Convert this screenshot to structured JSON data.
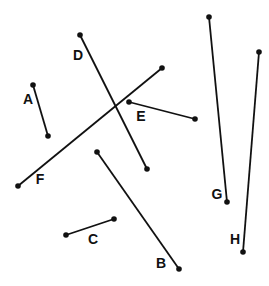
{
  "diagram": {
    "width": 269,
    "height": 286,
    "stroke_color": "#111111",
    "background": "#ffffff",
    "segments": [
      {
        "id": "A",
        "label": "A",
        "x1": 33,
        "y1": 85,
        "x2": 48,
        "y2": 136,
        "lx": 28,
        "ly": 104
      },
      {
        "id": "B",
        "label": "B",
        "x1": 97,
        "y1": 152,
        "x2": 179,
        "y2": 269,
        "lx": 161,
        "ly": 268
      },
      {
        "id": "C",
        "label": "C",
        "x1": 66,
        "y1": 235,
        "x2": 114,
        "y2": 219,
        "lx": 93,
        "ly": 244
      },
      {
        "id": "D",
        "label": "D",
        "x1": 80,
        "y1": 35,
        "x2": 147,
        "y2": 169,
        "lx": 78,
        "ly": 60
      },
      {
        "id": "E",
        "label": "E",
        "x1": 129,
        "y1": 102,
        "x2": 195,
        "y2": 119,
        "lx": 141,
        "ly": 121
      },
      {
        "id": "F",
        "label": "F",
        "x1": 18,
        "y1": 186,
        "x2": 162,
        "y2": 68,
        "lx": 40,
        "ly": 184
      },
      {
        "id": "G",
        "label": "G",
        "x1": 209,
        "y1": 17,
        "x2": 227,
        "y2": 202,
        "lx": 217,
        "ly": 199
      },
      {
        "id": "H",
        "label": "H",
        "x1": 259,
        "y1": 52,
        "x2": 243,
        "y2": 252,
        "lx": 235,
        "ly": 244
      }
    ]
  }
}
